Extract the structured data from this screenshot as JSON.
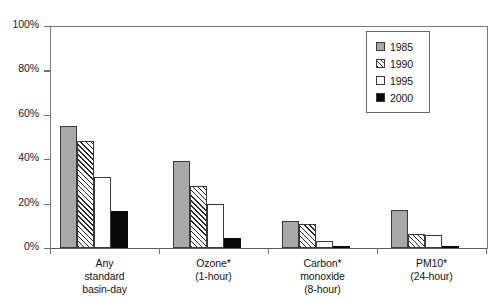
{
  "chart_data": {
    "type": "bar",
    "title": "",
    "subtitle": "",
    "xlabel": "",
    "ylabel": "",
    "ylim": [
      0,
      100
    ],
    "y_unit": "%",
    "grid": false,
    "legend_position": "top-right",
    "categories": [
      "Any\nstandard\nbasin-day",
      "Ozone*\n(1-hour)",
      "Carbon*\nmonoxide\n(8-hour)",
      "PM10*\n(24-hour)"
    ],
    "category_lines": [
      [
        "Any",
        "standard",
        "basin-day"
      ],
      [
        "Ozone*",
        "(1-hour)"
      ],
      [
        "Carbon*",
        "monoxide",
        "(8-hour)"
      ],
      [
        "PM10*",
        "(24-hour)"
      ]
    ],
    "series": [
      {
        "name": "1985",
        "fill": "solid-gray",
        "color": "#a8a8a8",
        "values": [
          55,
          39,
          12,
          17
        ]
      },
      {
        "name": "1990",
        "fill": "diagonal-hatch",
        "color": "#ffffff",
        "values": [
          48,
          28,
          11,
          6.5
        ]
      },
      {
        "name": "1995",
        "fill": "empty-white",
        "color": "#ffffff",
        "values": [
          32,
          20,
          3,
          6
        ]
      },
      {
        "name": "2000",
        "fill": "solid-black",
        "color": "#0a0a0a",
        "values": [
          16.5,
          4.5,
          1,
          1
        ]
      }
    ],
    "y_ticks": [
      {
        "value": 100,
        "label": "100%"
      },
      {
        "value": 80,
        "label": "80%"
      },
      {
        "value": 60,
        "label": "60%"
      },
      {
        "value": 40,
        "label": "40%"
      },
      {
        "value": 20,
        "label": "20%"
      },
      {
        "value": 0,
        "label": "0%"
      }
    ]
  },
  "legend": {
    "items": [
      {
        "label": "1985"
      },
      {
        "label": "1990"
      },
      {
        "label": "1995"
      },
      {
        "label": "2000"
      }
    ]
  }
}
